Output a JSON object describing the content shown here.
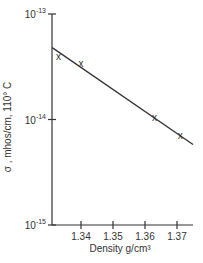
{
  "chart_data": {
    "type": "line",
    "title": "",
    "xlabel": "Density  g/cm³",
    "ylabel": "σ , mhos/cm, 110° C",
    "xlim": [
      1.331,
      1.376
    ],
    "ylim": [
      1e-15,
      1e-13
    ],
    "yscale": "log",
    "grid": false,
    "legend": null,
    "x_ticks": [
      "1.34",
      "1.35",
      "1.36",
      "1.37"
    ],
    "y_ticks": [
      {
        "base": "10",
        "exp": "-13",
        "value": 1e-13
      },
      {
        "base": "10",
        "exp": "-14",
        "value": 1e-14
      },
      {
        "base": "10",
        "exp": "-15",
        "value": 1e-15
      }
    ],
    "series": [
      {
        "name": "measured",
        "marker": "x",
        "x": [
          1.333,
          1.34,
          1.363,
          1.371
        ],
        "y": [
          4e-14,
          3.4e-14,
          1.05e-14,
          7.1e-15
        ]
      },
      {
        "name": "fit line",
        "marker": "none",
        "x": [
          1.331,
          1.375
        ],
        "y": [
          4.8e-14,
          5.8e-15
        ]
      }
    ]
  },
  "colors": {
    "ink": "#333333",
    "background": "#ffffff"
  },
  "marker_glyph": "x"
}
